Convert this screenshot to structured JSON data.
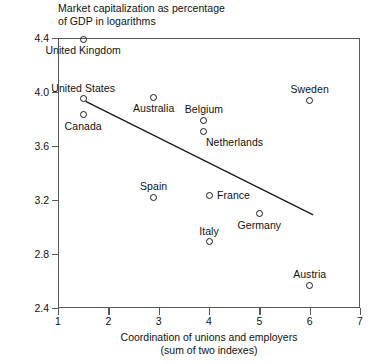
{
  "chart_data": {
    "type": "scatter",
    "title": "Market capitalization as percentage of GDP in logarithms",
    "title_lines": [
      "Market capitalization as percentage",
      "of GDP in logarithms"
    ],
    "xlabel": "Coordination of unions and employers (sum of two indexes)",
    "xlabel_lines": [
      "Coordination of unions and employers",
      "(sum of two indexes)"
    ],
    "ylabel": "Market capitalization as percentage of GDP in logarithms",
    "xlim": [
      1,
      7
    ],
    "ylim": [
      2.4,
      4.4
    ],
    "xticks": [
      1,
      2,
      3,
      4,
      5,
      6,
      7
    ],
    "xtick_labels": [
      "1",
      "2",
      "3",
      "4",
      "5",
      "6",
      "7"
    ],
    "yticks": [
      2.4,
      2.8,
      3.2,
      3.6,
      4.0,
      4.4
    ],
    "ytick_labels": [
      "2.4",
      "2.8",
      "3.2",
      "3.6",
      "4.0",
      "4.4"
    ],
    "grid": false,
    "legend": "none",
    "marker_style": "open-circle",
    "points": [
      {
        "label": "United Kingdom",
        "x": 1.5,
        "y": 4.39,
        "label_pos": "below"
      },
      {
        "label": "United States",
        "x": 1.5,
        "y": 3.95,
        "label_pos": "above"
      },
      {
        "label": "Canada",
        "x": 1.5,
        "y": 3.83,
        "label_pos": "below"
      },
      {
        "label": "Australia",
        "x": 2.9,
        "y": 3.96,
        "label_pos": "below"
      },
      {
        "label": "Belgium",
        "x": 3.9,
        "y": 3.79,
        "label_pos": "above"
      },
      {
        "label": "Netherlands",
        "x": 3.9,
        "y": 3.71,
        "label_pos": "below-right"
      },
      {
        "label": "Sweden",
        "x": 6.0,
        "y": 3.94,
        "label_pos": "above"
      },
      {
        "label": "Spain",
        "x": 2.9,
        "y": 3.22,
        "label_pos": "above"
      },
      {
        "label": "France",
        "x": 4.0,
        "y": 3.23,
        "label_pos": "right"
      },
      {
        "label": "Germany",
        "x": 5.0,
        "y": 3.1,
        "label_pos": "below"
      },
      {
        "label": "Italy",
        "x": 4.0,
        "y": 2.89,
        "label_pos": "above"
      },
      {
        "label": "Austria",
        "x": 6.0,
        "y": 2.57,
        "label_pos": "above"
      }
    ],
    "trendline": {
      "x_start": 1.55,
      "y_start": 3.93,
      "x_end": 6.07,
      "y_end": 3.09,
      "style": "solid"
    },
    "colors": {
      "frame": "#55595c",
      "marker": "#1a1a1a",
      "text": "#111111",
      "trendline": "#1a1a1a",
      "background": "#ffffff"
    }
  }
}
